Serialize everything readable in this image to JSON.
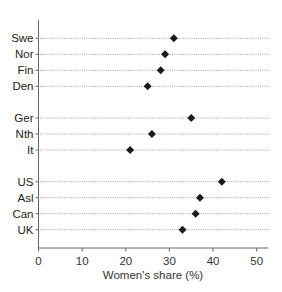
{
  "chart_data": {
    "type": "scatter",
    "subtype": "dot-plot",
    "title": "",
    "xlabel": "Women's share (%)",
    "ylabel": "",
    "xlim": [
      0,
      52
    ],
    "xticks": [
      0,
      10,
      20,
      30,
      40,
      50
    ],
    "xtick_labels": [
      "0",
      "10",
      "20",
      "30",
      "40",
      "50"
    ],
    "grid": "dotted horizontal guide lines per row",
    "legend": null,
    "marker": "diamond",
    "groups": [
      [
        "Swe",
        "Nor",
        "Fin",
        "Den"
      ],
      [
        "Ger",
        "Nth",
        "It"
      ],
      [
        "US",
        "Asl",
        "Can",
        "UK"
      ]
    ],
    "categories": [
      "Swe",
      "Nor",
      "Fin",
      "Den",
      "Ger",
      "Nth",
      "It",
      "US",
      "Asl",
      "Can",
      "UK"
    ],
    "values": [
      31,
      29,
      28,
      25,
      35,
      26,
      21,
      42,
      37,
      36,
      33
    ]
  },
  "colors": {
    "marker": "#1a1a1a",
    "axis": "#666666",
    "guide": "#888888",
    "text": "#222222"
  }
}
